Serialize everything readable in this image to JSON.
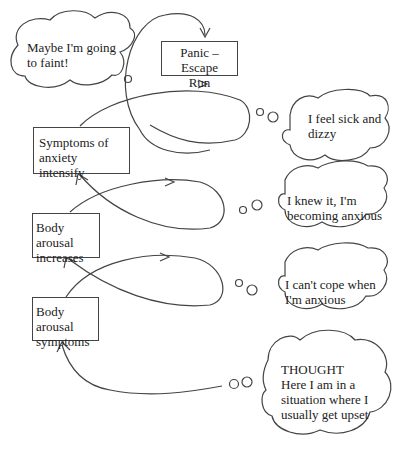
{
  "diagram": {
    "boxes": {
      "panic": {
        "line1": "Panic – Escape",
        "line2": "Run"
      },
      "symptoms_intensify": {
        "line1": "Symptoms of",
        "line2": "anxiety intensify"
      },
      "arousal_increases": {
        "line1": "Body arousal",
        "line2": "increases"
      },
      "arousal_symptoms": {
        "line1": "Body arousal",
        "line2": "symptoms"
      }
    },
    "thoughts": {
      "faint": {
        "line1": "Maybe I'm going",
        "line2": "to faint!"
      },
      "sick": {
        "line1": "I feel sick and",
        "line2": "dizzy"
      },
      "knew": {
        "line1": "I knew it, I'm",
        "line2": "becoming anxious"
      },
      "cope": {
        "line1": "I can't cope when",
        "line2": "I'm anxious"
      },
      "initial": {
        "title": "THOUGHT",
        "line1": "Here I am in a",
        "line2": "situation where I",
        "line3": "usually get upset"
      }
    }
  }
}
